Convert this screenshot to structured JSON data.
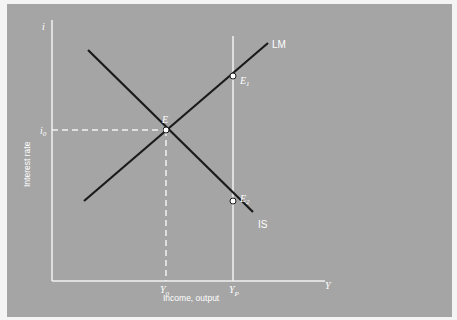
{
  "diagram": {
    "colors": {
      "background": "#a5a5a5",
      "axes": "#f2f2f2",
      "curve": "#1a1a1a",
      "point_fill": "#ffffff"
    },
    "axes": {
      "y_axis_symbol": "i",
      "x_axis_symbol": "Y",
      "y_label": "Interest rate",
      "x_label": "Income, output"
    },
    "curves": {
      "lm_label": "LM",
      "is_label": "IS"
    },
    "points": {
      "e": {
        "label": "E"
      },
      "e1": {
        "label": "E",
        "sub": "1"
      },
      "e2": {
        "label": "E",
        "sub": "2"
      }
    },
    "ticks": {
      "i0": {
        "label": "i",
        "sub": "0"
      },
      "y0": {
        "label": "Y",
        "sub": "0"
      },
      "yp": {
        "label": "Y",
        "sub": "P"
      }
    }
  }
}
